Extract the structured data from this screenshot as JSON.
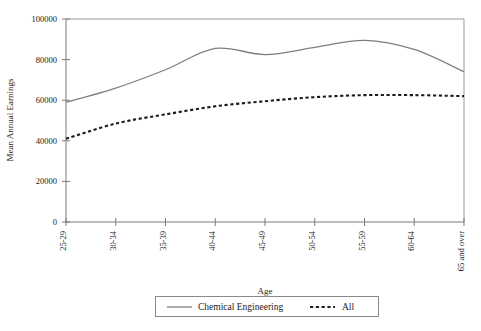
{
  "chart_data": {
    "type": "line",
    "title": "",
    "xlabel": "Age",
    "ylabel": "Mean Annual Earnings",
    "categories": [
      "25-29",
      "30-34",
      "35-39",
      "40-44",
      "45-49",
      "50-54",
      "55-59",
      "60-64",
      "65 and over"
    ],
    "series": [
      {
        "name": "Chemical Engineering",
        "style": "solid",
        "color": "#7f7f7f",
        "values": [
          59000,
          66000,
          75000,
          85500,
          82500,
          86000,
          89500,
          85000,
          74000
        ]
      },
      {
        "name": "All",
        "style": "dashed",
        "color": "#1c1c1c",
        "values": [
          41000,
          48500,
          53000,
          57000,
          59500,
          61500,
          62500,
          62500,
          62000
        ]
      }
    ],
    "ylim": [
      0,
      100000
    ],
    "yticks": [
      0,
      20000,
      40000,
      60000,
      80000,
      100000
    ],
    "yticklabels": [
      "0",
      "20000",
      "40000",
      "60000",
      "80000",
      "100000"
    ],
    "grid": false,
    "legend_position": "bottom"
  },
  "legend": {
    "entries": [
      {
        "label": "Chemical Engineering"
      },
      {
        "label": "All"
      }
    ]
  },
  "axes": {
    "x_title": "Age",
    "y_title": "Mean Annual Earnings"
  }
}
